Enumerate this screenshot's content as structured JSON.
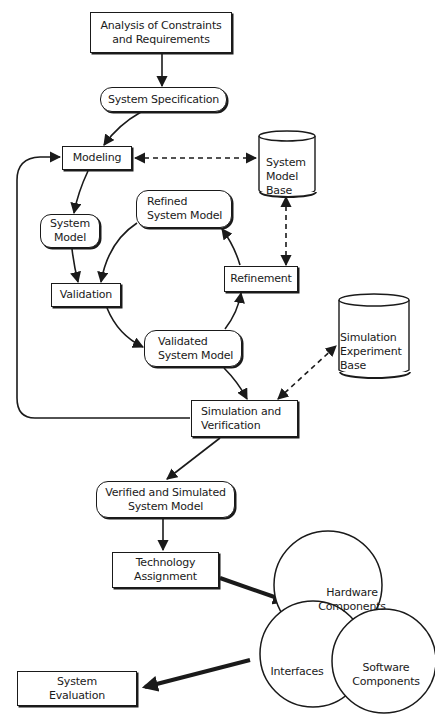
{
  "diagram": {
    "nodes": {
      "analysis": {
        "label": "Analysis of Constraints\nand Requirements",
        "shape": "rectangle"
      },
      "system_specification": {
        "label": "System Specification",
        "shape": "rounded"
      },
      "modeling": {
        "label": "Modeling",
        "shape": "rectangle"
      },
      "system_model_base": {
        "label": "System\nModel\nBase",
        "shape": "cylinder"
      },
      "system_model": {
        "label": "System\nModel",
        "shape": "rounded"
      },
      "refined_system_model": {
        "label": "Refined\nSystem Model",
        "shape": "rounded"
      },
      "validation": {
        "label": "Validation",
        "shape": "rectangle"
      },
      "refinement": {
        "label": "Refinement",
        "shape": "rectangle"
      },
      "validated_system_model": {
        "label": "Validated\nSystem Model",
        "shape": "rounded"
      },
      "simulation_experiment_base": {
        "label": "Simulation\nExperiment\nBase",
        "shape": "cylinder"
      },
      "simulation_verification": {
        "label": "Simulation and\nVerification",
        "shape": "rectangle"
      },
      "verified_simulated_model": {
        "label": "Verified and Simulated\nSystem Model",
        "shape": "rounded"
      },
      "technology_assignment": {
        "label": "Technology\nAssignment",
        "shape": "rectangle"
      },
      "hardware_components": {
        "label": "Hardware\nComponents",
        "shape": "circle"
      },
      "interfaces": {
        "label": "Interfaces",
        "shape": "circle"
      },
      "software_components": {
        "label": "Software\nComponents",
        "shape": "circle"
      },
      "system_evaluation": {
        "label": "System\nEvaluation",
        "shape": "rectangle"
      }
    },
    "edges": [
      {
        "from": "Analysis of Constraints and Requirements",
        "to": "System Specification",
        "style": "solid"
      },
      {
        "from": "System Specification",
        "to": "Modeling",
        "style": "solid"
      },
      {
        "from": "Modeling",
        "to": "System Model Base",
        "style": "dashed-bidirectional"
      },
      {
        "from": "Modeling",
        "to": "System Model",
        "style": "solid"
      },
      {
        "from": "System Model",
        "to": "Validation",
        "style": "solid"
      },
      {
        "from": "Refined System Model",
        "to": "Validation",
        "style": "solid"
      },
      {
        "from": "Validation",
        "to": "Validated System Model",
        "style": "solid"
      },
      {
        "from": "Validated System Model",
        "to": "Refinement",
        "style": "solid"
      },
      {
        "from": "Refinement",
        "to": "Refined System Model",
        "style": "solid"
      },
      {
        "from": "Refinement",
        "to": "System Model Base",
        "style": "dashed-bidirectional"
      },
      {
        "from": "Validated System Model",
        "to": "Simulation and Verification",
        "style": "solid"
      },
      {
        "from": "Simulation and Verification",
        "to": "Simulation Experiment Base",
        "style": "dashed-bidirectional"
      },
      {
        "from": "Simulation and Verification",
        "to": "Modeling",
        "style": "solid-loop"
      },
      {
        "from": "Simulation and Verification",
        "to": "Verified and Simulated System Model",
        "style": "solid"
      },
      {
        "from": "Verified and Simulated System Model",
        "to": "Technology Assignment",
        "style": "solid"
      },
      {
        "from": "Technology Assignment",
        "to": "Hardware/Interfaces/Software",
        "style": "bold"
      },
      {
        "from": "Hardware/Interfaces/Software",
        "to": "System Evaluation",
        "style": "bold"
      }
    ],
    "colors": {
      "ink": "#1a1a1a",
      "background": "#ffffff"
    }
  }
}
